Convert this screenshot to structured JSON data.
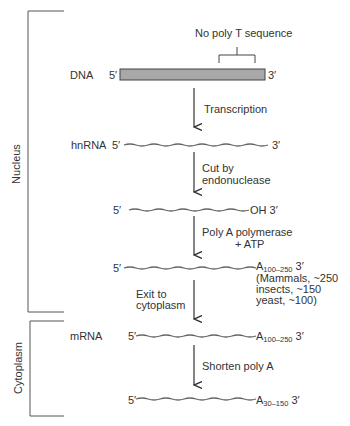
{
  "compartments": {
    "nucleus": "Nucleus",
    "cytoplasm": "Cytoplasm"
  },
  "annotation": "No poly T sequence",
  "rows": {
    "dna": {
      "label": "DNA",
      "five": "5′",
      "three": "3′"
    },
    "hnrna": {
      "label": "hnRNA",
      "five": "5′",
      "three": "3′"
    },
    "cut": {
      "five": "5′",
      "three": "OH 3′"
    },
    "polyA": {
      "five": "5′",
      "a": "A",
      "sub": "100–250",
      "three": "3′"
    },
    "mrna": {
      "label": "mRNA",
      "five": "5′",
      "a": "A",
      "sub": "100–250",
      "three": "3′"
    },
    "short": {
      "five": "5′",
      "a": "A",
      "sub": "30–150",
      "three": "3′"
    }
  },
  "steps": {
    "s1": "Transcription",
    "s2a": "Cut by",
    "s2b": "endonuclease",
    "s3a": "Poly A polymerase",
    "s3b": "+ ATP",
    "s4a": "Exit to",
    "s4b": "cytoplasm",
    "s5": "Shorten poly A"
  },
  "note": {
    "l1": "(Mammals, ~250",
    "l2": "insects, ~150",
    "l3": "yeast, ~100)"
  },
  "colors": {
    "bar": "#a8a8a8",
    "line": "#555555"
  }
}
